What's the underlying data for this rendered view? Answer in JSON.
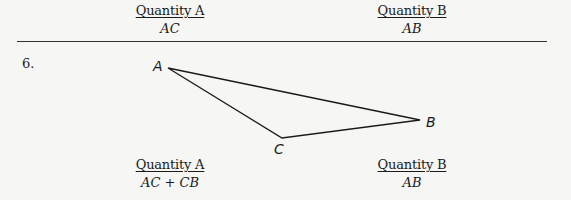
{
  "top_comparison": {
    "quantity_a": {
      "label": "Quantity A",
      "value": "AC"
    },
    "quantity_b": {
      "label": "Quantity B",
      "value": "AB"
    }
  },
  "question": {
    "number": "6.",
    "figure": {
      "type": "triangle",
      "vertices": [
        {
          "name": "A",
          "x": 168,
          "y": 68
        },
        {
          "name": "B",
          "x": 420,
          "y": 120
        },
        {
          "name": "C",
          "x": 282,
          "y": 138
        }
      ],
      "labels": {
        "A": "A",
        "B": "B",
        "C": "C"
      }
    },
    "quantity_a": {
      "label": "Quantity A",
      "value": "AC + CB"
    },
    "quantity_b": {
      "label": "Quantity B",
      "value": "AB"
    }
  }
}
